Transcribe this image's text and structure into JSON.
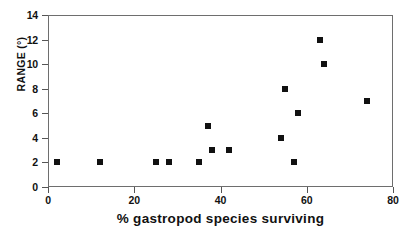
{
  "chart_data": {
    "type": "scatter",
    "title": "",
    "xlabel": "% gastropod species surviving",
    "ylabel": "RANGE (°)",
    "xlim": [
      0,
      80
    ],
    "ylim": [
      0,
      14
    ],
    "xticks": [
      0,
      20,
      40,
      60,
      80
    ],
    "yticks": [
      0,
      2,
      4,
      6,
      8,
      10,
      12,
      14
    ],
    "xtick_labels": [
      "0",
      "20",
      "40",
      "60",
      "80"
    ],
    "ytick_labels": [
      "0",
      "2",
      "4",
      "6",
      "8",
      "10",
      "12",
      "14"
    ],
    "grid": false,
    "legend": null,
    "marker": "square",
    "marker_color": "#111111",
    "points": [
      {
        "x": 2,
        "y": 2
      },
      {
        "x": 12,
        "y": 2
      },
      {
        "x": 25,
        "y": 2
      },
      {
        "x": 28,
        "y": 2
      },
      {
        "x": 35,
        "y": 2
      },
      {
        "x": 37,
        "y": 5
      },
      {
        "x": 38,
        "y": 3
      },
      {
        "x": 42,
        "y": 3
      },
      {
        "x": 54,
        "y": 4
      },
      {
        "x": 55,
        "y": 8
      },
      {
        "x": 57,
        "y": 2
      },
      {
        "x": 58,
        "y": 6
      },
      {
        "x": 63,
        "y": 12
      },
      {
        "x": 64,
        "y": 10
      },
      {
        "x": 74,
        "y": 7
      }
    ]
  }
}
